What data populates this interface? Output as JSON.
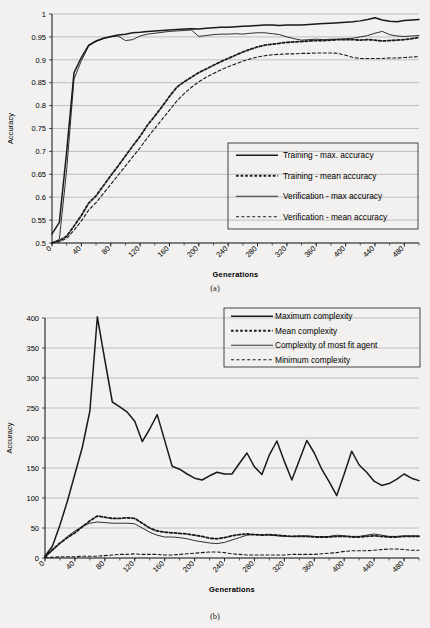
{
  "figure": {
    "caption_a": "(a)",
    "caption_b": "(b)"
  },
  "chart_data": [
    {
      "id": "a",
      "type": "line",
      "title": "",
      "xlabel": "Generations",
      "ylabel": "Accuracy",
      "xlim": [
        0,
        500
      ],
      "ylim": [
        0.5,
        1
      ],
      "ytick_step": 0.05,
      "xtick_step": 40,
      "minor_xtick_step": 20,
      "grid": true,
      "legend_position": "inside-bottom-right",
      "xticks": [
        "0",
        "40",
        "80",
        "120",
        "160",
        "200",
        "240",
        "280",
        "320",
        "360",
        "400",
        "440",
        "480"
      ],
      "yticks": [
        "0.5",
        "0.55",
        "0.6",
        "0.65",
        "0.7",
        "0.75",
        "0.8",
        "0.85",
        "0.9",
        "0.95",
        "1"
      ],
      "x": [
        0,
        10,
        20,
        30,
        40,
        50,
        60,
        70,
        80,
        90,
        100,
        110,
        120,
        130,
        140,
        150,
        160,
        170,
        180,
        190,
        200,
        210,
        220,
        230,
        240,
        250,
        260,
        270,
        280,
        290,
        300,
        310,
        320,
        330,
        340,
        350,
        360,
        370,
        380,
        390,
        400,
        410,
        420,
        430,
        440,
        450,
        460,
        470,
        480,
        490,
        500
      ],
      "series": [
        {
          "name": "Training - max. accuracy",
          "style": "solid-thick",
          "values": [
            0.52,
            0.545,
            0.7,
            0.872,
            0.905,
            0.932,
            0.941,
            0.947,
            0.951,
            0.954,
            0.956,
            0.959,
            0.96,
            0.962,
            0.963,
            0.964,
            0.965,
            0.966,
            0.967,
            0.968,
            0.967,
            0.969,
            0.97,
            0.971,
            0.971,
            0.972,
            0.973,
            0.974,
            0.975,
            0.976,
            0.976,
            0.975,
            0.976,
            0.976,
            0.976,
            0.977,
            0.978,
            0.979,
            0.98,
            0.981,
            0.982,
            0.983,
            0.985,
            0.988,
            0.992,
            0.987,
            0.984,
            0.983,
            0.986,
            0.987,
            0.988
          ]
        },
        {
          "name": "Training - mean accuracy",
          "style": "dotted-thick",
          "values": [
            0.5,
            0.505,
            0.515,
            0.537,
            0.56,
            0.587,
            0.603,
            0.625,
            0.647,
            0.668,
            0.69,
            0.712,
            0.733,
            0.757,
            0.777,
            0.798,
            0.82,
            0.84,
            0.852,
            0.862,
            0.872,
            0.88,
            0.888,
            0.896,
            0.903,
            0.91,
            0.917,
            0.923,
            0.928,
            0.932,
            0.934,
            0.936,
            0.938,
            0.939,
            0.94,
            0.941,
            0.942,
            0.942,
            0.943,
            0.944,
            0.944,
            0.944,
            0.943,
            0.944,
            0.943,
            0.941,
            0.942,
            0.943,
            0.944,
            0.946,
            0.949
          ]
        },
        {
          "name": "Verification - max accuracy",
          "style": "solid-thin",
          "values": [
            0.5,
            0.508,
            0.66,
            0.858,
            0.898,
            0.93,
            0.94,
            0.946,
            0.95,
            0.952,
            0.942,
            0.944,
            0.952,
            0.956,
            0.958,
            0.96,
            0.962,
            0.963,
            0.964,
            0.965,
            0.951,
            0.953,
            0.955,
            0.956,
            0.956,
            0.957,
            0.956,
            0.958,
            0.959,
            0.959,
            0.957,
            0.955,
            0.95,
            0.946,
            0.943,
            0.944,
            0.945,
            0.944,
            0.945,
            0.945,
            0.946,
            0.947,
            0.95,
            0.953,
            0.958,
            0.962,
            0.955,
            0.952,
            0.951,
            0.952,
            0.953
          ]
        },
        {
          "name": "Verification - mean accuracy",
          "style": "dashed-thin",
          "values": [
            0.5,
            0.503,
            0.51,
            0.528,
            0.548,
            0.572,
            0.588,
            0.608,
            0.628,
            0.648,
            0.668,
            0.688,
            0.708,
            0.73,
            0.75,
            0.77,
            0.79,
            0.81,
            0.826,
            0.84,
            0.852,
            0.862,
            0.87,
            0.878,
            0.885,
            0.891,
            0.897,
            0.902,
            0.906,
            0.909,
            0.911,
            0.912,
            0.913,
            0.913,
            0.914,
            0.914,
            0.915,
            0.915,
            0.915,
            0.914,
            0.91,
            0.905,
            0.903,
            0.903,
            0.903,
            0.903,
            0.904,
            0.904,
            0.905,
            0.906,
            0.907
          ]
        }
      ]
    },
    {
      "id": "b",
      "type": "line",
      "title": "",
      "xlabel": "Generations",
      "ylabel": "Accuracy",
      "xlim": [
        0,
        500
      ],
      "ylim": [
        0,
        400
      ],
      "ytick_step": 50,
      "xtick_step": 40,
      "minor_xtick_step": 20,
      "grid": true,
      "legend_position": "top-right",
      "xticks": [
        "0",
        "40",
        "80",
        "120",
        "160",
        "200",
        "240",
        "280",
        "320",
        "360",
        "400",
        "440",
        "480"
      ],
      "yticks": [
        "0",
        "50",
        "100",
        "150",
        "200",
        "250",
        "300",
        "350",
        "400"
      ],
      "x": [
        0,
        10,
        20,
        30,
        40,
        50,
        60,
        70,
        80,
        90,
        100,
        110,
        120,
        130,
        140,
        150,
        160,
        170,
        180,
        190,
        200,
        210,
        220,
        230,
        240,
        250,
        260,
        270,
        280,
        290,
        300,
        310,
        320,
        330,
        340,
        350,
        360,
        370,
        380,
        390,
        400,
        410,
        420,
        430,
        440,
        450,
        460,
        470,
        480,
        490,
        500
      ],
      "series": [
        {
          "name": "Maximum complexity",
          "style": "solid-thick",
          "values": [
            3,
            20,
            55,
            95,
            140,
            185,
            245,
            402,
            330,
            260,
            252,
            243,
            228,
            194,
            215,
            239,
            196,
            153,
            148,
            140,
            133,
            130,
            137,
            143,
            140,
            140,
            158,
            175,
            152,
            139,
            172,
            195,
            161,
            130,
            163,
            196,
            175,
            148,
            127,
            104,
            140,
            178,
            155,
            143,
            128,
            121,
            124,
            131,
            140,
            133,
            129
          ]
        },
        {
          "name": "Mean complexity",
          "style": "dotted-thick",
          "values": [
            2,
            14,
            25,
            34,
            42,
            52,
            62,
            70,
            68,
            66,
            66,
            67,
            66,
            58,
            50,
            45,
            43,
            42,
            41,
            40,
            38,
            36,
            33,
            32,
            34,
            37,
            39,
            40,
            39,
            38,
            39,
            38,
            37,
            36,
            36,
            36,
            35,
            35,
            35,
            36,
            36,
            35,
            35,
            36,
            37,
            36,
            35,
            35,
            36,
            36,
            36
          ]
        },
        {
          "name": "Complexity of most fit agent",
          "style": "solid-thin",
          "values": [
            2,
            12,
            24,
            36,
            45,
            53,
            58,
            60,
            59,
            58,
            58,
            58,
            57,
            50,
            43,
            38,
            35,
            35,
            34,
            32,
            29,
            27,
            25,
            24,
            26,
            30,
            34,
            38,
            39,
            39,
            38,
            37,
            36,
            36,
            37,
            37,
            36,
            35,
            36,
            38,
            37,
            36,
            36,
            38,
            40,
            38,
            36,
            36,
            37,
            37,
            37
          ]
        },
        {
          "name": "Minimum complexity",
          "style": "dashed-thin",
          "values": [
            1,
            1,
            2,
            2,
            2,
            3,
            3,
            3,
            4,
            5,
            6,
            6,
            7,
            6,
            6,
            6,
            5,
            5,
            6,
            7,
            8,
            9,
            10,
            10,
            9,
            7,
            6,
            5,
            5,
            5,
            5,
            5,
            5,
            6,
            6,
            6,
            6,
            7,
            8,
            9,
            11,
            12,
            12,
            12,
            13,
            14,
            15,
            15,
            14,
            13,
            13
          ]
        }
      ]
    }
  ]
}
